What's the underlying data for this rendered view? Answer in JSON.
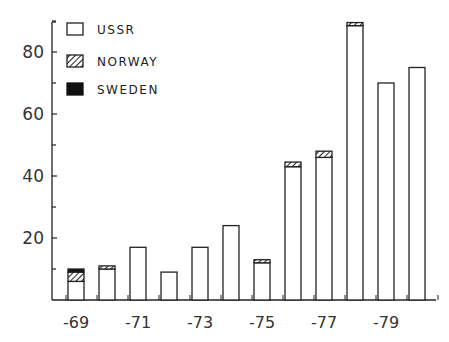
{
  "chart_data": {
    "type": "bar",
    "stacked": true,
    "title": "",
    "xlabel": "",
    "ylabel": "",
    "ylim": [
      0,
      92
    ],
    "yticks": [
      20,
      40,
      60,
      80
    ],
    "yminor_ticks": [
      10,
      30,
      50,
      70,
      90
    ],
    "grid": false,
    "legend_position": "upper-left",
    "categories": [
      "-69",
      "-70",
      "-71",
      "-72",
      "-73",
      "-74",
      "-75",
      "-76",
      "-77",
      "-78",
      "-79",
      "-80"
    ],
    "xtick_labels": [
      "-69",
      "-71",
      "-73",
      "-75",
      "-77",
      "-79"
    ],
    "series": [
      {
        "name": "USSR",
        "pattern": "empty",
        "values": [
          6,
          10,
          17,
          9,
          17,
          24,
          12,
          43,
          46,
          88.5,
          70,
          75
        ]
      },
      {
        "name": "NORWAY",
        "pattern": "hatched",
        "values": [
          3,
          1,
          0,
          0,
          0,
          0,
          1,
          1.5,
          2,
          1,
          0,
          0
        ]
      },
      {
        "name": "SWEDEN",
        "pattern": "solid-black",
        "values": [
          1,
          0,
          0,
          0,
          0,
          0,
          0,
          0,
          0,
          0,
          0,
          0
        ]
      }
    ]
  },
  "legend": {
    "items": [
      {
        "label": "USSR"
      },
      {
        "label": "NORWAY"
      },
      {
        "label": "SWEDEN"
      }
    ]
  },
  "axis": {
    "y_labels": [
      "80",
      "60",
      "40",
      "20"
    ],
    "x_labels": [
      "-69",
      "-71",
      "-73",
      "-75",
      "-77",
      "-79"
    ]
  }
}
